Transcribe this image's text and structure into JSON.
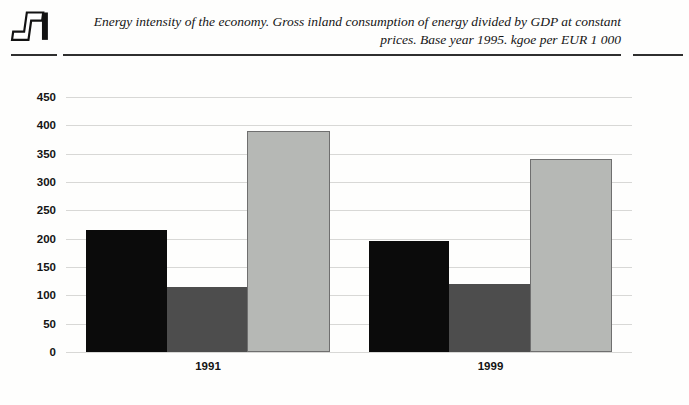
{
  "header": {
    "logo_name": "publication-logo",
    "title_lines": [
      "Energy intensity of the economy. Gross inland consumption of energy divided by GDP at constant",
      "prices. Base year 1995. kgoe per EUR 1 000"
    ]
  },
  "chart_data": {
    "type": "bar",
    "title": "Energy intensity of the economy. Gross inland consumption of energy divided by GDP at constant prices. Base year 1995. kgoe per EUR 1 000",
    "categories": [
      "1991",
      "1999"
    ],
    "series": [
      {
        "name": "black",
        "color": "#0b0b0b",
        "values": [
          215,
          196
        ]
      },
      {
        "name": "dark-gray",
        "color": "#4d4d4d",
        "values": [
          115,
          120
        ]
      },
      {
        "name": "light-gray",
        "color": "#b6b8b5",
        "border": "#6f6f6f",
        "values": [
          390,
          340
        ]
      }
    ],
    "xlabel": "",
    "ylabel": "",
    "ylim": [
      0,
      450
    ],
    "yticks": [
      0,
      50,
      100,
      150,
      200,
      250,
      300,
      350,
      400,
      450
    ],
    "grid": true,
    "legend_position": "none"
  }
}
